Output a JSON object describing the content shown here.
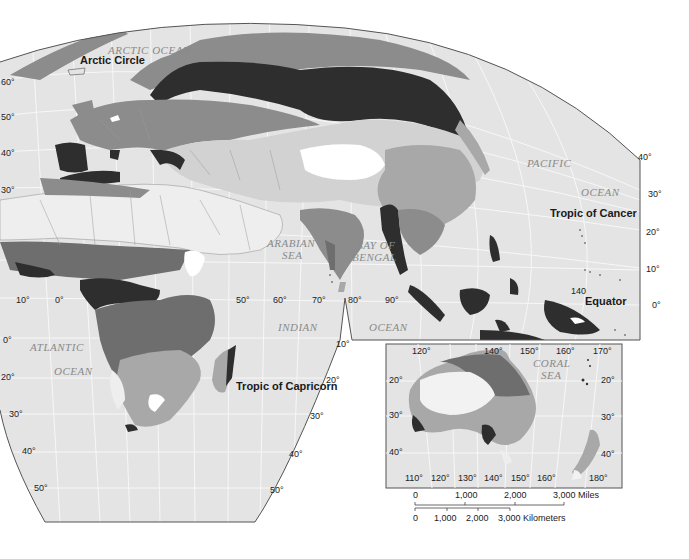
{
  "map": {
    "type": "climate-region map, Eastern Hemisphere (grayscale)",
    "colors": {
      "ocean": "#e4e4e4",
      "graticule": "#f6f6f6",
      "frame": "#555555",
      "region_darkest": "#2e2e2e",
      "region_dark": "#6e6e6e",
      "region_medium": "#8c8c8c",
      "region_light": "#a8a8a8",
      "region_pale": "#d2d2d2",
      "region_white": "#ffffff",
      "borders": "#8a8a8a"
    },
    "oceans": {
      "arctic": "ARCTIC  OCEAN",
      "pacific_1": "PACIFIC",
      "pacific_2": "OCEAN",
      "arabian_1": "ARABIAN",
      "arabian_2": "SEA",
      "bengal_1": "BAY OF",
      "bengal_2": "BENGAL",
      "indian_1": "INDIAN",
      "indian_2": "OCEAN",
      "atlantic_1": "ATLANTIC",
      "atlantic_2": "OCEAN",
      "coral_1": "CORAL",
      "coral_2": "SEA"
    },
    "lines": {
      "arctic_circle": "Arctic Circle",
      "tropic_cancer": "Tropic of Cancer",
      "equator": "Equator",
      "tropic_capricorn": "Tropic of Capricorn"
    },
    "lat_left": [
      "60°",
      "50°",
      "40°",
      "30°",
      "0°",
      "20°",
      "30°",
      "40°",
      "50°"
    ],
    "lat_right": [
      "40°",
      "30°",
      "20°",
      "10°",
      "0°"
    ],
    "lat_south_right": [
      "10°",
      "20°",
      "30°",
      "40°",
      "50°"
    ],
    "lon_equator": [
      "10°",
      "0°",
      "50°",
      "60°",
      "70°",
      "80°",
      "90°"
    ],
    "lon_140": "140",
    "inset": {
      "top_lon": [
        "120°",
        "140°",
        "150°",
        "160°",
        "170°"
      ],
      "bottom_lon": [
        "110°",
        "120°",
        "130°",
        "140°",
        "150°",
        "160°",
        "180°"
      ],
      "left_lat": [
        "20°",
        "30°",
        "40°"
      ],
      "right_lat": [
        "20°",
        "30°",
        "40°"
      ]
    },
    "scale": {
      "miles": [
        "0",
        "1,000",
        "2,000",
        "3,000 Miles"
      ],
      "km": [
        "0",
        "1,000",
        "2,000",
        "3,000 Kilometers"
      ]
    }
  }
}
